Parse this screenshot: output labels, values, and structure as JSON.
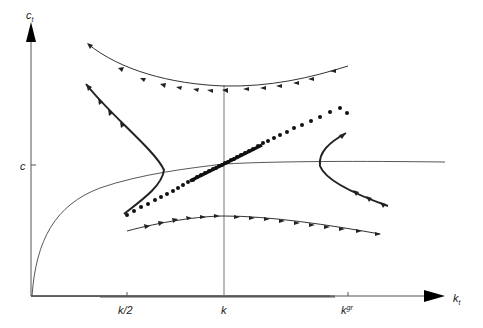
{
  "diagram": {
    "type": "phase-diagram",
    "axes": {
      "y_label": "c",
      "y_label_sub": "t",
      "x_label": "k",
      "x_label_sub": "t",
      "x_ticks": [
        {
          "label": "k/2",
          "x": 128
        },
        {
          "label": "k",
          "x": 224
        },
        {
          "label": "k",
          "sup": "gr",
          "x": 348
        }
      ],
      "y_ticks": [
        {
          "label": "c",
          "y": 165
        }
      ]
    },
    "curves": [
      {
        "name": "c-dot-zero-locus",
        "description": "concave curve from origin rising to plateau"
      },
      {
        "name": "k-dot-zero-locus",
        "description": "vertical line at k"
      },
      {
        "name": "saddle-path",
        "description": "dotted stable arm through steady state"
      },
      {
        "name": "trajectory-upper",
        "description": "U-shaped trajectory above, arrows pointing left"
      },
      {
        "name": "trajectory-left",
        "description": "C-shaped trajectory on left, arrows up-left"
      },
      {
        "name": "trajectory-right",
        "description": "C-shaped trajectory on right, arrows down-right"
      },
      {
        "name": "trajectory-lower",
        "description": "arched trajectory below, arrows pointing right"
      }
    ],
    "colors": {
      "line": "#333333",
      "axis": "#555555",
      "dots": "#111111"
    }
  }
}
